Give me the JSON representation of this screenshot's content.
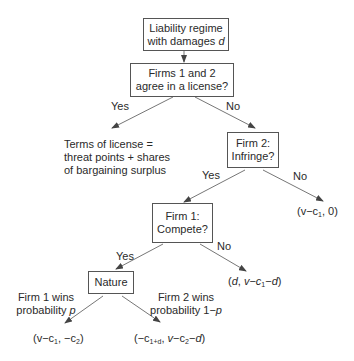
{
  "nodes": {
    "root": {
      "line1": "Liability regime",
      "line2_prefix": "with damages ",
      "line2_var": "d"
    },
    "license": {
      "line1": "Firms 1 and 2",
      "line2": "agree in a license?"
    },
    "firm2": {
      "line1": "Firm 2:",
      "line2": "Infringe?"
    },
    "firm1": {
      "line1": "Firm 1:",
      "line2": "Compete?"
    },
    "nature": {
      "label": "Nature"
    }
  },
  "edges": {
    "license_yes": "Yes",
    "license_no": "No",
    "firm2_yes": "Yes",
    "firm2_no": "No",
    "firm1_yes": "Yes",
    "firm1_no": "No",
    "nature_left": {
      "line1": "Firm 1 wins",
      "line2_prefix": "probability ",
      "line2_var": "p"
    },
    "nature_right": {
      "line1": "Firm 2 wins",
      "line2_prefix": "probability 1−",
      "line2_var": "p"
    }
  },
  "outcomes": {
    "license_terms": {
      "line1": "Terms of license =",
      "line2": "threat points + shares",
      "line3": "of bargaining surplus"
    },
    "no_infringe": {
      "text": "(v−c₁, 0)",
      "parts": [
        "(v−c",
        "1",
        ", 0)"
      ]
    },
    "no_compete": {
      "text": "(d, v−c₁−d)",
      "parts": [
        "(",
        "d",
        ", ",
        "v",
        "−",
        "c",
        "1",
        "−",
        "d",
        ")"
      ]
    },
    "firm1_wins": {
      "text": "(v−c₁, −c₂)",
      "parts": [
        "(v−c",
        "1",
        ", −c",
        "2",
        ")"
      ]
    },
    "firm2_wins": {
      "text": "(−c₁₊ᵈ, v−c₂−d)",
      "parts": [
        "(−c",
        "1+d",
        ", ",
        "v",
        "−c",
        "2",
        "−",
        "d",
        ")"
      ]
    }
  },
  "colors": {
    "line": "#555555",
    "text": "#2a2a2a"
  }
}
